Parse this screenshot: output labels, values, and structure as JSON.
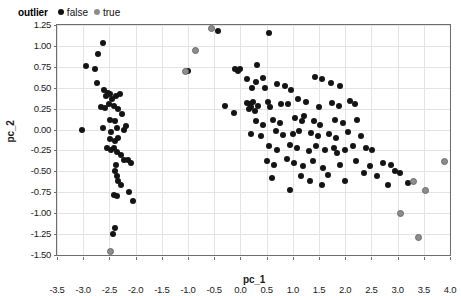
{
  "legend": {
    "title": "outlier",
    "items": [
      {
        "label": "false",
        "color": "#141414"
      },
      {
        "label": "true",
        "color": "#8d8d8d"
      }
    ]
  },
  "chart_data": {
    "type": "scatter",
    "title": "",
    "xlabel": "pc_1",
    "ylabel": "pc_2",
    "xlim": [
      -3.5,
      4.0
    ],
    "ylim": [
      -1.5,
      1.25
    ],
    "xticks": [
      "-3.5",
      "-3.0",
      "-2.5",
      "-2.0",
      "-1.5",
      "-1.0",
      "-0.5",
      "0.0",
      "0.5",
      "1.0",
      "1.5",
      "2.0",
      "2.5",
      "3.0",
      "3.5",
      "4.0"
    ],
    "yticks": [
      "1.25",
      "1.00",
      "0.75",
      "0.50",
      "0.25",
      "0.00",
      "-0.25",
      "-0.50",
      "-0.75",
      "-1.00",
      "-1.25",
      "-1.50"
    ],
    "xtick_values": [
      -3.5,
      -3.0,
      -2.5,
      -2.0,
      -1.5,
      -1.0,
      -0.5,
      0.0,
      0.5,
      1.0,
      1.5,
      2.0,
      2.5,
      3.0,
      3.5,
      4.0
    ],
    "ytick_values": [
      1.25,
      1.0,
      0.75,
      0.5,
      0.25,
      0.0,
      -0.25,
      -0.5,
      -0.75,
      -1.0,
      -1.25,
      -1.5
    ],
    "grid": true,
    "legend_position": "top-left",
    "series": [
      {
        "name": "false",
        "color": "#141414",
        "points": [
          [
            -2.62,
            1.03
          ],
          [
            -2.95,
            0.76
          ],
          [
            -2.78,
            0.72
          ],
          [
            -2.72,
            0.9
          ],
          [
            -2.73,
            0.56
          ],
          [
            -2.6,
            0.47
          ],
          [
            -2.53,
            0.44
          ],
          [
            -2.57,
            0.4
          ],
          [
            -2.48,
            0.42
          ],
          [
            -2.45,
            0.36
          ],
          [
            -2.38,
            0.4
          ],
          [
            -2.3,
            0.42
          ],
          [
            -2.66,
            0.27
          ],
          [
            -2.58,
            0.26
          ],
          [
            -2.5,
            0.3
          ],
          [
            -2.42,
            0.28
          ],
          [
            -2.34,
            0.25
          ],
          [
            -2.26,
            0.19
          ],
          [
            -2.48,
            0.12
          ],
          [
            -2.4,
            0.1
          ],
          [
            -3.02,
            0.0
          ],
          [
            -2.62,
            0.02
          ],
          [
            -2.46,
            -0.03
          ],
          [
            -2.36,
            0.02
          ],
          [
            -2.23,
            0.0
          ],
          [
            -2.18,
            0.04
          ],
          [
            -2.48,
            -0.11
          ],
          [
            -2.4,
            -0.14
          ],
          [
            -2.33,
            -0.1
          ],
          [
            -2.55,
            -0.22
          ],
          [
            -2.47,
            -0.25
          ],
          [
            -2.42,
            -0.22
          ],
          [
            -2.36,
            -0.27
          ],
          [
            -2.28,
            -0.3
          ],
          [
            -2.22,
            -0.37
          ],
          [
            -2.15,
            -0.36
          ],
          [
            -2.08,
            -0.4
          ],
          [
            -2.37,
            -0.42
          ],
          [
            -2.4,
            -0.5
          ],
          [
            -2.35,
            -0.56
          ],
          [
            -2.33,
            -0.62
          ],
          [
            -2.28,
            -0.66
          ],
          [
            -2.42,
            -0.78
          ],
          [
            -2.36,
            -0.8
          ],
          [
            -2.12,
            -0.75
          ],
          [
            -2.05,
            -0.86
          ],
          [
            -2.4,
            -1.18
          ],
          [
            -2.44,
            -1.25
          ],
          [
            -0.42,
            1.18
          ],
          [
            -1.0,
            0.7
          ],
          [
            -0.1,
            0.72
          ],
          [
            -0.05,
            0.7
          ],
          [
            0.0,
            0.72
          ],
          [
            0.32,
            0.77
          ],
          [
            0.55,
            1.16
          ],
          [
            0.12,
            0.6
          ],
          [
            0.3,
            0.57
          ],
          [
            0.43,
            0.62
          ],
          [
            0.22,
            0.5
          ],
          [
            0.47,
            0.5
          ],
          [
            0.7,
            0.55
          ],
          [
            0.85,
            0.52
          ],
          [
            0.96,
            0.47
          ],
          [
            1.42,
            0.63
          ],
          [
            1.55,
            0.6
          ],
          [
            1.72,
            0.56
          ],
          [
            1.9,
            0.52
          ],
          [
            -0.3,
            0.28
          ],
          [
            -0.12,
            0.2
          ],
          [
            0.12,
            0.32
          ],
          [
            0.18,
            0.3
          ],
          [
            0.24,
            0.33
          ],
          [
            0.21,
            0.27
          ],
          [
            0.16,
            0.24
          ],
          [
            0.27,
            0.22
          ],
          [
            0.33,
            0.28
          ],
          [
            0.52,
            0.33
          ],
          [
            0.57,
            0.27
          ],
          [
            0.78,
            0.31
          ],
          [
            0.9,
            0.3
          ],
          [
            1.1,
            0.36
          ],
          [
            1.25,
            0.33
          ],
          [
            1.5,
            0.27
          ],
          [
            1.75,
            0.32
          ],
          [
            1.88,
            0.28
          ],
          [
            2.1,
            0.34
          ],
          [
            2.18,
            0.3
          ],
          [
            0.3,
            0.1
          ],
          [
            0.44,
            0.06
          ],
          [
            0.62,
            0.12
          ],
          [
            0.75,
            0.08
          ],
          [
            1.05,
            0.14
          ],
          [
            1.18,
            0.1
          ],
          [
            1.22,
            0.16
          ],
          [
            1.4,
            0.1
          ],
          [
            1.52,
            0.06
          ],
          [
            1.8,
            0.12
          ],
          [
            1.95,
            0.08
          ],
          [
            2.22,
            0.12
          ],
          [
            0.2,
            -0.05
          ],
          [
            0.4,
            -0.08
          ],
          [
            0.68,
            -0.02
          ],
          [
            0.82,
            -0.06
          ],
          [
            1.0,
            -0.05
          ],
          [
            1.12,
            -0.02
          ],
          [
            1.35,
            -0.04
          ],
          [
            1.48,
            -0.08
          ],
          [
            1.7,
            -0.05
          ],
          [
            1.83,
            -0.1
          ],
          [
            2.05,
            -0.03
          ],
          [
            2.3,
            -0.08
          ],
          [
            0.55,
            -0.2
          ],
          [
            0.7,
            -0.24
          ],
          [
            0.95,
            -0.18
          ],
          [
            1.08,
            -0.22
          ],
          [
            1.3,
            -0.26
          ],
          [
            1.45,
            -0.2
          ],
          [
            1.62,
            -0.25
          ],
          [
            1.78,
            -0.22
          ],
          [
            1.85,
            -0.28
          ],
          [
            2.0,
            -0.24
          ],
          [
            2.15,
            -0.2
          ],
          [
            2.4,
            -0.22
          ],
          [
            2.52,
            -0.25
          ],
          [
            0.5,
            -0.38
          ],
          [
            0.65,
            -0.42
          ],
          [
            0.88,
            -0.35
          ],
          [
            1.02,
            -0.4
          ],
          [
            1.2,
            -0.44
          ],
          [
            1.38,
            -0.38
          ],
          [
            1.58,
            -0.46
          ],
          [
            1.9,
            -0.42
          ],
          [
            2.2,
            -0.38
          ],
          [
            2.48,
            -0.44
          ],
          [
            2.72,
            -0.4
          ],
          [
            2.88,
            -0.42
          ],
          [
            0.6,
            -0.58
          ],
          [
            1.15,
            -0.56
          ],
          [
            1.32,
            -0.62
          ],
          [
            1.68,
            -0.54
          ],
          [
            2.35,
            -0.52
          ],
          [
            2.6,
            -0.56
          ],
          [
            2.95,
            -0.5
          ],
          [
            3.05,
            -0.52
          ],
          [
            0.95,
            -0.72
          ],
          [
            1.55,
            -0.66
          ],
          [
            2.0,
            -0.62
          ],
          [
            2.82,
            -0.66
          ],
          [
            3.2,
            -0.64
          ]
        ]
      },
      {
        "name": "true",
        "color": "#8d8d8d",
        "points": [
          [
            -0.57,
            1.22
          ],
          [
            -0.87,
            0.95
          ],
          [
            -1.05,
            0.7
          ],
          [
            -2.48,
            -1.45
          ],
          [
            3.3,
            -0.62
          ],
          [
            3.52,
            -0.72
          ],
          [
            3.88,
            -0.38
          ],
          [
            3.38,
            -1.28
          ],
          [
            3.05,
            -1.0
          ]
        ]
      }
    ]
  }
}
